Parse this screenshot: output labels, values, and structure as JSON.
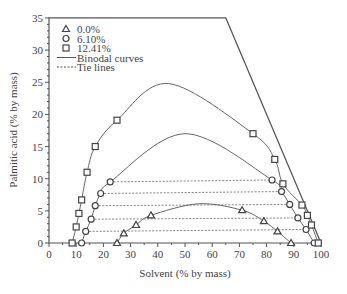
{
  "chart_data": {
    "type": "scatter",
    "title": "",
    "xlabel": "Solvent (% by mass)",
    "ylabel": "Palmitic acid (% by mass)",
    "xlim": [
      0,
      100
    ],
    "ylim": [
      0,
      35
    ],
    "xticks": [
      "0",
      "10",
      "20",
      "30",
      "40",
      "50",
      "60",
      "70",
      "80",
      "90",
      "100"
    ],
    "yticks": [
      "0",
      "5",
      "10",
      "15",
      "20",
      "25",
      "30",
      "35"
    ],
    "legend": [
      {
        "marker": "triangle",
        "label": "0.0%"
      },
      {
        "marker": "circle",
        "label": "6.10%"
      },
      {
        "marker": "square",
        "label": "12.41%"
      },
      {
        "line": "solid",
        "label": "Binodal curves"
      },
      {
        "line": "dashed",
        "label": "Tie lines"
      }
    ],
    "series": [
      {
        "name": "0.0%",
        "marker": "triangle",
        "points": [
          [
            25,
            0
          ],
          [
            27.5,
            1.5
          ],
          [
            32,
            2.8
          ],
          [
            37.5,
            4.3
          ],
          [
            71,
            5.1
          ],
          [
            79,
            3.4
          ],
          [
            84,
            1.8
          ],
          [
            89,
            0
          ]
        ]
      },
      {
        "name": "6.10%",
        "marker": "circle",
        "points": [
          [
            12,
            0
          ],
          [
            13.5,
            1.8
          ],
          [
            15.5,
            3.7
          ],
          [
            17,
            5.8
          ],
          [
            19,
            7.7
          ],
          [
            22.5,
            9.5
          ],
          [
            82,
            9.8
          ],
          [
            85.5,
            8
          ],
          [
            88.5,
            6
          ],
          [
            91.5,
            3.9
          ],
          [
            94.5,
            2.1
          ],
          [
            97.5,
            0
          ]
        ]
      },
      {
        "name": "12.41%",
        "marker": "square",
        "points": [
          [
            8.5,
            0
          ],
          [
            10,
            2.5
          ],
          [
            11,
            4.6
          ],
          [
            12,
            6.7
          ],
          [
            14,
            11
          ],
          [
            17,
            15
          ],
          [
            25,
            19.1
          ],
          [
            75,
            17
          ],
          [
            83,
            13
          ],
          [
            86,
            9.2
          ],
          [
            93,
            5.9
          ],
          [
            95,
            4.3
          ],
          [
            96.5,
            2.8
          ],
          [
            99,
            0
          ]
        ]
      }
    ],
    "tie_lines": [
      [
        [
          13.5,
          1.8
        ],
        [
          94.5,
          2.1
        ]
      ],
      [
        [
          15.5,
          3.7
        ],
        [
          91.5,
          3.9
        ]
      ],
      [
        [
          17,
          5.8
        ],
        [
          88.5,
          6
        ]
      ],
      [
        [
          19,
          7.7
        ],
        [
          85.5,
          8
        ]
      ],
      [
        [
          22.5,
          9.5
        ],
        [
          82,
          9.8
        ]
      ]
    ],
    "frame": [
      [
        0,
        35
      ],
      [
        65,
        35
      ],
      [
        100,
        0
      ]
    ]
  }
}
